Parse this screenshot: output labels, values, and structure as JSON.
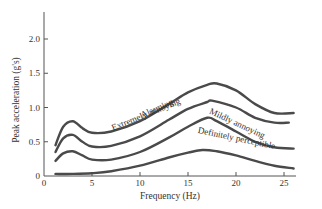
{
  "chart_data": {
    "type": "line",
    "title": "",
    "xlabel": "Frequency (Hz)",
    "ylabel": "Peak acceleration (g's)",
    "xlim": [
      0,
      27
    ],
    "ylim": [
      0,
      2.4
    ],
    "x_ticks": [
      0,
      5,
      10,
      15,
      20,
      25
    ],
    "x_tick_labels": [
      "0",
      "5",
      "10",
      "15",
      "20",
      "25"
    ],
    "y_ticks": [
      0,
      0.5,
      1.0,
      1.5,
      2.0
    ],
    "y_tick_labels": [
      "0",
      "0.5",
      "1.0",
      "1.5",
      "2.0"
    ],
    "grid": false,
    "legend": "inline labels along curves",
    "series": [
      {
        "name": "Alarming",
        "x": [
          1.2,
          2,
          3,
          4,
          5,
          7,
          10,
          13,
          15,
          17,
          18,
          20,
          22,
          24,
          26
        ],
        "values": [
          0.45,
          0.72,
          0.8,
          0.7,
          0.63,
          0.65,
          0.8,
          1.05,
          1.22,
          1.33,
          1.35,
          1.25,
          1.05,
          0.92,
          0.92
        ]
      },
      {
        "name": "Extremely annoying",
        "x": [
          1.2,
          2,
          3,
          4,
          5,
          7,
          10,
          13,
          15,
          17,
          17.5,
          20,
          22,
          24,
          25.5
        ],
        "values": [
          0.35,
          0.55,
          0.6,
          0.5,
          0.43,
          0.44,
          0.58,
          0.82,
          0.98,
          1.08,
          1.1,
          1.0,
          0.85,
          0.78,
          0.78
        ]
      },
      {
        "name": "Mildly annoying",
        "x": [
          1.2,
          2,
          3,
          4,
          5,
          7,
          10,
          13,
          15,
          17,
          18,
          20,
          22,
          24,
          26
        ],
        "values": [
          0.22,
          0.33,
          0.36,
          0.3,
          0.24,
          0.24,
          0.35,
          0.56,
          0.72,
          0.85,
          0.8,
          0.65,
          0.5,
          0.42,
          0.4
        ]
      },
      {
        "name": "Definitely perceptible",
        "x": [
          1.2,
          3,
          5,
          7,
          10,
          13,
          15,
          16.5,
          18,
          20,
          22,
          24,
          26
        ],
        "values": [
          0.03,
          0.03,
          0.04,
          0.07,
          0.15,
          0.27,
          0.34,
          0.38,
          0.36,
          0.3,
          0.22,
          0.15,
          0.11
        ]
      }
    ]
  }
}
